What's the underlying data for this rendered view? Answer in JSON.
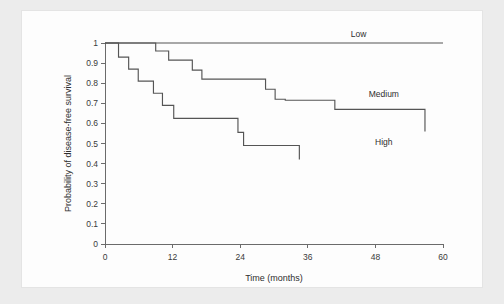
{
  "figure": {
    "background_color": "#ececec",
    "panel_color": "#fdfdfd",
    "curve_color": "#555555",
    "axis_color": "#6b6b6b"
  },
  "chart_data": {
    "type": "line",
    "subtype": "kaplan-meier-step",
    "title": "",
    "subtitle": "",
    "xlabel": "Time (months)",
    "ylabel": "Probability of disease-free survival",
    "xlim": [
      0,
      60
    ],
    "ylim": [
      0,
      1
    ],
    "xticks": [
      0,
      12,
      24,
      36,
      48,
      60
    ],
    "xtick_labels": [
      "0",
      "12",
      "24",
      "36",
      "48",
      "60"
    ],
    "yticks": [
      0,
      0.1,
      0.2,
      0.3,
      0.4,
      0.5,
      0.6,
      0.7,
      0.8,
      0.9,
      1
    ],
    "ytick_labels": [
      "0",
      "0.1",
      "0.2",
      "0.3",
      "0.4",
      "0.5",
      "0.6",
      "0.7",
      "0.8",
      "0.9",
      "1"
    ],
    "grid": false,
    "legend_position": "inline-right",
    "series": [
      {
        "name": "Low",
        "label": "Low",
        "label_x": 45.0,
        "label_y": 1.045,
        "x": [
          0,
          60
        ],
        "y": [
          1,
          1
        ]
      },
      {
        "name": "Medium",
        "label": "Medium",
        "label_x": 49.5,
        "label_y": 0.745,
        "x": [
          0,
          9,
          9,
          11.3,
          11.3,
          15.5,
          15.5,
          17.2,
          17.2,
          28.5,
          28.5,
          30.2,
          30.2,
          32.0,
          32.0,
          40.8,
          40.8,
          56.8,
          56.8
        ],
        "y": [
          1,
          1,
          0.96,
          0.96,
          0.915,
          0.915,
          0.865,
          0.865,
          0.82,
          0.82,
          0.77,
          0.77,
          0.72,
          0.72,
          0.715,
          0.715,
          0.67,
          0.67,
          0.56
        ]
      },
      {
        "name": "High",
        "label": "High",
        "label_x": 49.5,
        "label_y": 0.505,
        "x": [
          0,
          2.4,
          2.4,
          4.2,
          4.2,
          5.9,
          5.9,
          8.6,
          8.6,
          10.2,
          10.2,
          12.2,
          12.2,
          23.6,
          23.6,
          24.6,
          24.6,
          34.5,
          34.5
        ],
        "y": [
          1,
          1,
          0.93,
          0.93,
          0.87,
          0.87,
          0.81,
          0.81,
          0.75,
          0.75,
          0.69,
          0.69,
          0.625,
          0.625,
          0.555,
          0.555,
          0.49,
          0.49,
          0.42
        ]
      }
    ]
  }
}
